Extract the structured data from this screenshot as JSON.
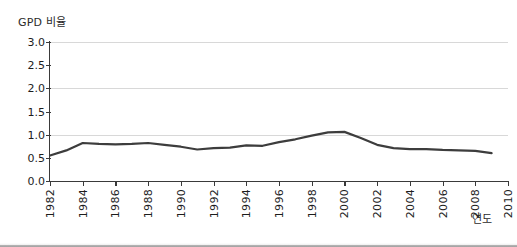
{
  "chart_data": {
    "type": "line",
    "title": "",
    "ylabel": "GPD 비율",
    "xlabel": "연도",
    "ylim": [
      0.0,
      3.0
    ],
    "xlim": [
      1982,
      2010
    ],
    "grid": "horizontal gridlines at 1.0, 2.0, 3.0",
    "legend": "none",
    "ytick_labels": [
      "3.0",
      "2.5",
      "2.0",
      "1.5",
      "1.0",
      "0.5",
      "0.0"
    ],
    "ytick_values": [
      3.0,
      2.5,
      2.0,
      1.5,
      1.0,
      0.5,
      0.0
    ],
    "xtick_labels": [
      "1982",
      "1984",
      "1986",
      "1988",
      "1990",
      "1992",
      "1994",
      "1996",
      "1998",
      "2000",
      "2002",
      "2004",
      "2006",
      "2008",
      "2010"
    ],
    "xtick_values": [
      1982,
      1984,
      1986,
      1988,
      1990,
      1992,
      1994,
      1996,
      1998,
      2000,
      2002,
      2004,
      2006,
      2008,
      2010
    ],
    "series": [
      {
        "name": "GPD 비율",
        "color": "#3d3d3d",
        "x": [
          1982,
          1983,
          1984,
          1985,
          1986,
          1987,
          1988,
          1989,
          1990,
          1991,
          1992,
          1993,
          1994,
          1995,
          1996,
          1997,
          1998,
          1999,
          2000,
          2001,
          2002,
          2003,
          2004,
          2005,
          2006,
          2007,
          2008,
          2009
        ],
        "values": [
          0.55,
          0.66,
          0.82,
          0.8,
          0.79,
          0.8,
          0.82,
          0.78,
          0.74,
          0.68,
          0.71,
          0.72,
          0.77,
          0.76,
          0.84,
          0.9,
          0.98,
          1.05,
          1.06,
          0.93,
          0.78,
          0.71,
          0.69,
          0.69,
          0.67,
          0.66,
          0.65,
          0.6
        ]
      }
    ]
  }
}
